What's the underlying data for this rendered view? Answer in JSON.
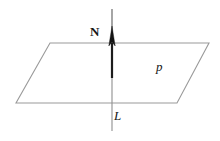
{
  "figure": {
    "background_color": "#ffffff",
    "width": 220,
    "height": 141,
    "labels": {
      "normal_vector": "N",
      "line": "L",
      "plane": "p"
    },
    "colors": {
      "plane_edge": "#9a9a9a",
      "line_thin": "#8f8f8f",
      "vector_shaft": "#1c1c1c",
      "arrow_head": "#141414",
      "text": "#161616"
    },
    "geometry": {
      "plane_polygon": [
        {
          "x": 50,
          "y": 43
        },
        {
          "x": 209,
          "y": 43
        },
        {
          "x": 177,
          "y": 103
        },
        {
          "x": 16,
          "y": 103
        }
      ],
      "line_x": 112,
      "line_top_y": 9,
      "line_bottom_y": 131,
      "arrow_tip_y": 26,
      "arrow_base_y": 46,
      "arrow_half_width": 3,
      "vector_shaft_top_y": 43,
      "vector_shaft_bottom_y": 76
    }
  }
}
